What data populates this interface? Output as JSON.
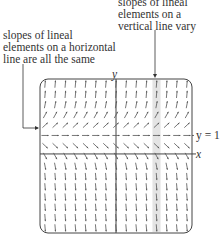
{
  "annotations": {
    "vertical": [
      "slopes of lineal",
      "elements on a",
      "vertical line vary"
    ],
    "horizontal": [
      "slopes of lineal",
      "elements on a horizontal",
      "line are all the same"
    ]
  },
  "axes": {
    "x_label": "x",
    "y_label": "y",
    "line_label": "y = 1"
  },
  "field": {
    "equation_hint": "dy/dx depends on y only; slope zero at y = 1",
    "columns": 15,
    "rows": 15,
    "equilibrium_row": 5,
    "highlight_column": 11
  },
  "colors": {
    "frame": "#444444",
    "arrow": "#555555",
    "highlight": "#e4e4e4"
  }
}
